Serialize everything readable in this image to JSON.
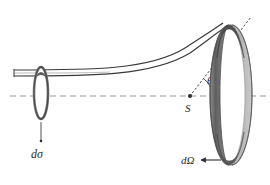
{
  "figure": {
    "name": "scattering-cross-section-diagram",
    "background_color": "#ffffff",
    "stroke_color": "#3a3a3a",
    "axis_color": "#8c8c8c",
    "ring_dark_color": "#6e6e6e",
    "ring_light_color": "#b8b8b8",
    "ring_edge_color": "#4a4a4a",
    "labels": {
      "d_sigma": "dσ",
      "d_omega": "dΩ",
      "theta": "θ",
      "scatterer": "S"
    },
    "elements": {
      "incoming_beam_label": "incident beam tube",
      "target_ring_label": "solid angle ring",
      "aperture_label": "cross-section aperture ring",
      "symmetry_axis_label": "dashed symmetry axis",
      "scattering_ray_label": "dotted scattering direction",
      "angle_arc_label": "scattering angle arc",
      "d_sigma_leader_label": "leader line to d-sigma",
      "d_omega_leader_label": "arrow leader to d-omega"
    },
    "geometry": {
      "axis_y": 96,
      "axis_x_start": 10,
      "axis_x_end": 268,
      "source_point": [
        190,
        96
      ],
      "aperture_center": [
        41,
        93
      ],
      "aperture_rx": 7,
      "aperture_ry": 26,
      "ring_center": [
        232,
        95
      ],
      "ring_rx": 20,
      "ring_ry": 70,
      "theta_degrees": 52
    }
  }
}
